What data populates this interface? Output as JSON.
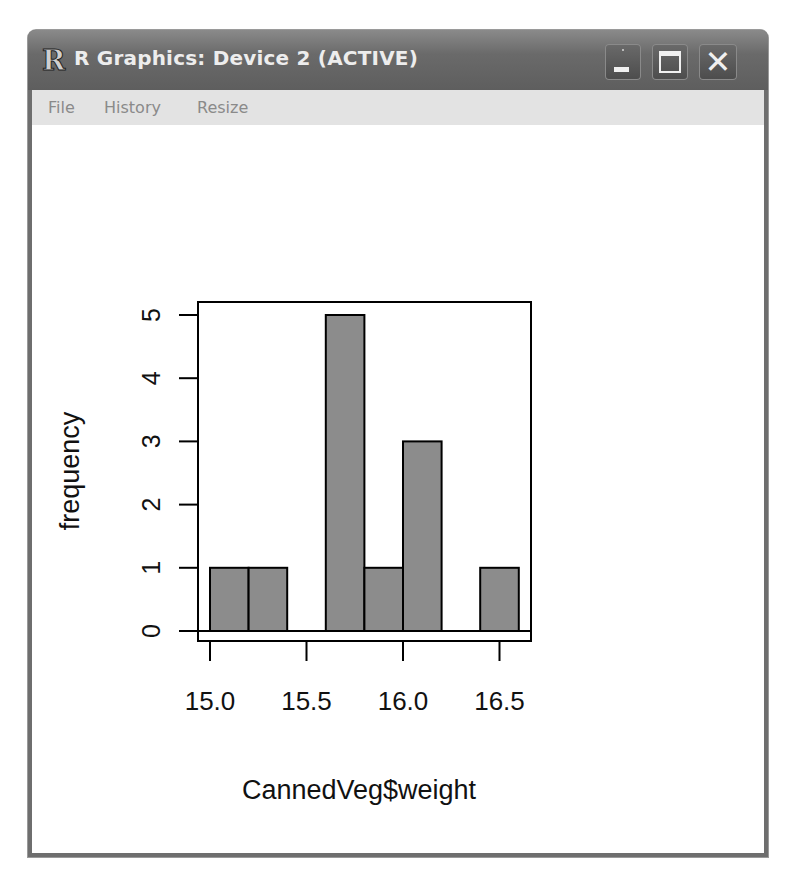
{
  "window": {
    "title": "R Graphics: Device 2 (ACTIVE)",
    "app_icon": "r-logo-icon",
    "app_icon_glyph": "R",
    "controls": {
      "minimize": "minimize-icon",
      "maximize": "maximize-icon",
      "close": "close-icon",
      "close_glyph": "✕"
    }
  },
  "menu": {
    "items": [
      {
        "label": "File"
      },
      {
        "label": "History"
      },
      {
        "label": "Resize"
      }
    ]
  },
  "colors": {
    "bar_fill": "#8c8c8c",
    "bar_stroke": "#000000",
    "titlebar": "#6a6a6a",
    "menubar": "#e3e3e3"
  },
  "chart_data": {
    "type": "bar",
    "subtype": "histogram",
    "title": "",
    "xlabel": "CannedVeg$weight",
    "ylabel": "frequency",
    "bins": [
      {
        "start": 15.0,
        "end": 15.2,
        "count": 1
      },
      {
        "start": 15.2,
        "end": 15.4,
        "count": 1
      },
      {
        "start": 15.4,
        "end": 15.6,
        "count": 0
      },
      {
        "start": 15.6,
        "end": 15.8,
        "count": 5
      },
      {
        "start": 15.8,
        "end": 16.0,
        "count": 1
      },
      {
        "start": 16.0,
        "end": 16.2,
        "count": 3
      },
      {
        "start": 16.2,
        "end": 16.4,
        "count": 0
      },
      {
        "start": 16.4,
        "end": 16.6,
        "count": 1
      }
    ],
    "categories": [
      "15.0-15.2",
      "15.2-15.4",
      "15.4-15.6",
      "15.6-15.8",
      "15.8-16.0",
      "16.0-16.2",
      "16.2-16.4",
      "16.4-16.6"
    ],
    "values": [
      1,
      1,
      0,
      5,
      1,
      3,
      0,
      1
    ],
    "x_ticks": [
      "15.0",
      "15.5",
      "16.0",
      "16.5"
    ],
    "y_ticks": [
      "0",
      "1",
      "2",
      "3",
      "4",
      "5"
    ],
    "xlim": [
      14.94,
      16.66
    ],
    "ylim": [
      0,
      5
    ],
    "grid": false,
    "legend": null,
    "box": true
  }
}
